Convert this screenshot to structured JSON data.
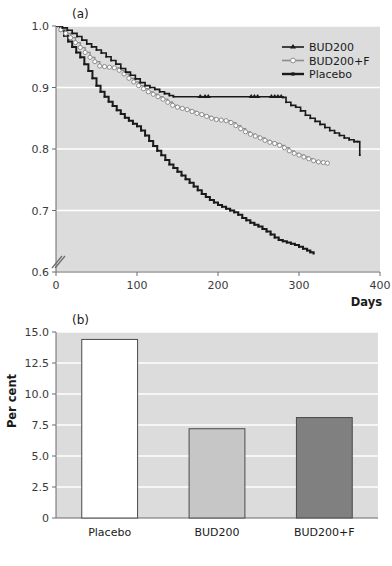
{
  "figure": {
    "panel_a_label": "(a)",
    "panel_b_label": "(b)"
  },
  "chart_data": [
    {
      "type": "line",
      "panel": "(a)",
      "title": "",
      "xlabel": "Days",
      "ylabel": "",
      "xlim": [
        0,
        400
      ],
      "ylim": [
        0.6,
        1.0
      ],
      "xticks": [
        0,
        100,
        200,
        300,
        400
      ],
      "xtick_labels": [
        "0",
        "100",
        "200",
        "300",
        "400"
      ],
      "yticks": [
        0.6,
        0.7,
        0.8,
        0.9,
        1.0
      ],
      "ytick_labels": [
        "0.6",
        "0.7",
        "0.8",
        "0.9",
        "1.0"
      ],
      "grid": true,
      "grid_color": "#ffffff",
      "plot_background": "#dcdcdc",
      "axis_break": true,
      "legend_position": "top-right",
      "legend": [
        "BUD200",
        "BUD200+F",
        "Placebo"
      ],
      "series": [
        {
          "name": "BUD200",
          "color": "#1a1a1a",
          "marker": "triangle-filled",
          "line_width": 1.6,
          "x": [
            0,
            8,
            14,
            20,
            26,
            32,
            38,
            44,
            50,
            56,
            62,
            68,
            74,
            80,
            86,
            92,
            98,
            104,
            110,
            116,
            122,
            128,
            134,
            140,
            145,
            180,
            185,
            188,
            240,
            244,
            248,
            265,
            272,
            276,
            280,
            284,
            290,
            296,
            302,
            308,
            314,
            320,
            326,
            332,
            338,
            344,
            350,
            356,
            362,
            368,
            372,
            375
          ],
          "y": [
            1.0,
            0.997,
            0.993,
            0.988,
            0.983,
            0.977,
            0.971,
            0.966,
            0.961,
            0.956,
            0.95,
            0.944,
            0.938,
            0.931,
            0.925,
            0.92,
            0.914,
            0.908,
            0.903,
            0.9,
            0.897,
            0.893,
            0.89,
            0.887,
            0.885,
            0.885,
            0.885,
            0.885,
            0.885,
            0.885,
            0.885,
            0.885,
            0.885,
            0.885,
            0.884,
            0.876,
            0.871,
            0.868,
            0.862,
            0.855,
            0.85,
            0.845,
            0.84,
            0.835,
            0.83,
            0.826,
            0.822,
            0.818,
            0.815,
            0.812,
            0.812,
            0.79
          ],
          "censor_x": [
            178,
            184,
            188,
            241,
            245,
            249,
            266,
            270,
            274,
            278
          ]
        },
        {
          "name": "BUD200+F",
          "color": "#8c8c8c",
          "marker": "circle-open",
          "line_width": 1.3,
          "x": [
            0,
            6,
            12,
            18,
            24,
            30,
            36,
            42,
            48,
            54,
            60,
            66,
            72,
            78,
            84,
            90,
            96,
            102,
            108,
            114,
            120,
            126,
            132,
            138,
            144,
            150,
            156,
            162,
            168,
            174,
            180,
            186,
            192,
            198,
            204,
            210,
            216,
            222,
            228,
            234,
            240,
            246,
            252,
            258,
            264,
            270,
            276,
            282,
            288,
            294,
            300,
            306,
            312,
            318,
            324,
            330,
            335
          ],
          "y": [
            1.0,
            0.994,
            0.988,
            0.981,
            0.973,
            0.965,
            0.957,
            0.949,
            0.942,
            0.935,
            0.934,
            0.933,
            0.932,
            0.928,
            0.922,
            0.915,
            0.909,
            0.903,
            0.898,
            0.893,
            0.889,
            0.885,
            0.881,
            0.876,
            0.871,
            0.868,
            0.866,
            0.864,
            0.861,
            0.858,
            0.856,
            0.853,
            0.85,
            0.848,
            0.847,
            0.846,
            0.843,
            0.838,
            0.833,
            0.828,
            0.824,
            0.821,
            0.818,
            0.814,
            0.811,
            0.809,
            0.806,
            0.802,
            0.797,
            0.793,
            0.79,
            0.787,
            0.784,
            0.781,
            0.779,
            0.778,
            0.777
          ]
        },
        {
          "name": "Placebo",
          "color": "#1a1a1a",
          "marker": "line-thick",
          "line_width": 2.0,
          "x": [
            0,
            5,
            10,
            15,
            20,
            25,
            30,
            35,
            40,
            45,
            50,
            55,
            60,
            65,
            70,
            75,
            80,
            85,
            90,
            95,
            100,
            105,
            110,
            115,
            120,
            125,
            130,
            135,
            140,
            145,
            150,
            155,
            160,
            165,
            170,
            175,
            180,
            185,
            190,
            195,
            200,
            205,
            210,
            215,
            220,
            225,
            230,
            235,
            240,
            245,
            250,
            255,
            260,
            265,
            270,
            275,
            280,
            285,
            290,
            295,
            300,
            305,
            310,
            314,
            318
          ],
          "y": [
            1.0,
            0.993,
            0.984,
            0.975,
            0.966,
            0.957,
            0.949,
            0.938,
            0.927,
            0.915,
            0.903,
            0.893,
            0.885,
            0.877,
            0.87,
            0.863,
            0.857,
            0.851,
            0.846,
            0.841,
            0.837,
            0.83,
            0.822,
            0.813,
            0.805,
            0.797,
            0.79,
            0.782,
            0.775,
            0.769,
            0.763,
            0.757,
            0.751,
            0.745,
            0.739,
            0.733,
            0.727,
            0.722,
            0.717,
            0.713,
            0.709,
            0.706,
            0.703,
            0.7,
            0.697,
            0.693,
            0.688,
            0.684,
            0.68,
            0.677,
            0.674,
            0.67,
            0.666,
            0.661,
            0.656,
            0.652,
            0.65,
            0.648,
            0.646,
            0.644,
            0.641,
            0.638,
            0.635,
            0.632,
            0.63
          ]
        }
      ]
    },
    {
      "type": "bar",
      "panel": "(b)",
      "title": "",
      "xlabel": "",
      "ylabel": "Per cent",
      "ylim": [
        0,
        15.0
      ],
      "yticks": [
        0,
        2.5,
        5.0,
        7.5,
        10.0,
        12.5,
        15.0
      ],
      "ytick_labels": [
        "0",
        "2.5",
        "5.0",
        "7.5",
        "10.0",
        "12.5",
        "15.0"
      ],
      "grid": true,
      "grid_color": "#ffffff",
      "plot_background": "#dcdcdc",
      "categories": [
        "Placebo",
        "BUD200",
        "BUD200+F"
      ],
      "values": [
        14.4,
        7.2,
        8.1
      ],
      "bar_colors": [
        "#ffffff",
        "#c6c6c6",
        "#808080"
      ],
      "bar_edge_color": "#4a4a4a"
    }
  ]
}
